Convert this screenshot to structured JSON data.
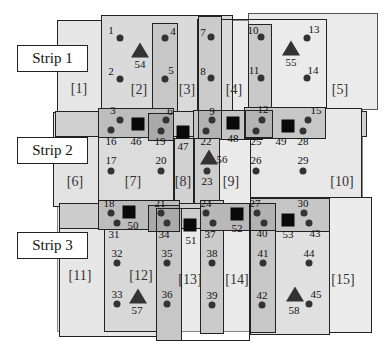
{
  "strips": [
    {
      "label": "Strip 1",
      "x": 17,
      "y": 45,
      "w": 71,
      "h": 27
    },
    {
      "label": "Strip 2",
      "x": 17,
      "y": 137,
      "w": 71,
      "h": 27
    },
    {
      "label": "Strip 3",
      "x": 17,
      "y": 232,
      "w": 71,
      "h": 27
    }
  ],
  "regions": [
    {
      "label": "[1]",
      "x": 79,
      "y": 89
    },
    {
      "label": "[2]",
      "x": 139,
      "y": 90
    },
    {
      "label": "[3]",
      "x": 187,
      "y": 90
    },
    {
      "label": "[4]",
      "x": 234,
      "y": 90
    },
    {
      "label": "[5]",
      "x": 340,
      "y": 90
    },
    {
      "label": "[6]",
      "x": 75,
      "y": 182
    },
    {
      "label": "[7]",
      "x": 133,
      "y": 182
    },
    {
      "label": "[8]",
      "x": 183,
      "y": 182
    },
    {
      "label": "[9]",
      "x": 231,
      "y": 182
    },
    {
      "label": "[10]",
      "x": 342,
      "y": 182
    },
    {
      "label": "[11]",
      "x": 80,
      "y": 276
    },
    {
      "label": "[12]",
      "x": 141,
      "y": 276
    },
    {
      "label": "[13]",
      "x": 190,
      "y": 280
    },
    {
      "label": "[14]",
      "x": 237,
      "y": 280
    },
    {
      "label": "[15]",
      "x": 343,
      "y": 280
    }
  ],
  "points": [
    {
      "id": "1",
      "x": 120,
      "y": 38,
      "lx": 111,
      "ly": 30
    },
    {
      "id": "2",
      "x": 120,
      "y": 79,
      "lx": 111,
      "ly": 71
    },
    {
      "id": "4",
      "x": 165,
      "y": 38,
      "lx": 173,
      "ly": 31
    },
    {
      "id": "5",
      "x": 165,
      "y": 79,
      "lx": 171,
      "ly": 70
    },
    {
      "id": "7",
      "x": 211,
      "y": 37,
      "lx": 203,
      "ly": 32
    },
    {
      "id": "8",
      "x": 211,
      "y": 78,
      "lx": 203,
      "ly": 71
    },
    {
      "id": "10",
      "x": 261,
      "y": 37,
      "lx": 253,
      "ly": 30
    },
    {
      "id": "11",
      "x": 261,
      "y": 78,
      "lx": 254,
      "ly": 70
    },
    {
      "id": "13",
      "x": 307,
      "y": 38,
      "lx": 314,
      "ly": 29
    },
    {
      "id": "14",
      "x": 307,
      "y": 78,
      "lx": 313,
      "ly": 70
    },
    {
      "id": "3",
      "x": 120,
      "y": 120,
      "lx": 113,
      "ly": 110
    },
    {
      "id": "16",
      "x": 111,
      "y": 130,
      "lx": 111,
      "ly": 141
    },
    {
      "id": "6",
      "x": 166,
      "y": 120,
      "lx": 170,
      "ly": 111
    },
    {
      "id": "19",
      "x": 161,
      "y": 131,
      "lx": 160,
      "ly": 141
    },
    {
      "id": "9",
      "x": 212,
      "y": 120,
      "lx": 212,
      "ly": 111
    },
    {
      "id": "22",
      "x": 206,
      "y": 131,
      "lx": 206,
      "ly": 141
    },
    {
      "id": "12",
      "x": 262,
      "y": 120,
      "lx": 263,
      "ly": 109
    },
    {
      "id": "25",
      "x": 256,
      "y": 131,
      "lx": 256,
      "ly": 141
    },
    {
      "id": "15",
      "x": 308,
      "y": 120,
      "lx": 316,
      "ly": 110
    },
    {
      "id": "28",
      "x": 303,
      "y": 131,
      "lx": 303,
      "ly": 141
    },
    {
      "id": "17",
      "x": 111,
      "y": 171,
      "lx": 111,
      "ly": 160
    },
    {
      "id": "20",
      "x": 161,
      "y": 171,
      "lx": 161,
      "ly": 160
    },
    {
      "id": "23",
      "x": 207,
      "y": 171,
      "lx": 207,
      "ly": 181
    },
    {
      "id": "26",
      "x": 256,
      "y": 171,
      "lx": 256,
      "ly": 160
    },
    {
      "id": "29",
      "x": 303,
      "y": 171,
      "lx": 303,
      "ly": 160
    },
    {
      "id": "18",
      "x": 111,
      "y": 213,
      "lx": 109,
      "ly": 203
    },
    {
      "id": "31",
      "x": 117,
      "y": 223,
      "lx": 114,
      "ly": 234
    },
    {
      "id": "21",
      "x": 161,
      "y": 213,
      "lx": 160,
      "ly": 203
    },
    {
      "id": "34",
      "x": 167,
      "y": 223,
      "lx": 164,
      "ly": 234
    },
    {
      "id": "24",
      "x": 206,
      "y": 213,
      "lx": 206,
      "ly": 203
    },
    {
      "id": "37",
      "x": 213,
      "y": 223,
      "lx": 210,
      "ly": 234
    },
    {
      "id": "27",
      "x": 257,
      "y": 213,
      "lx": 255,
      "ly": 203
    },
    {
      "id": "40",
      "x": 264,
      "y": 223,
      "lx": 262,
      "ly": 233
    },
    {
      "id": "30",
      "x": 304,
      "y": 213,
      "lx": 303,
      "ly": 203
    },
    {
      "id": "43",
      "x": 309,
      "y": 223,
      "lx": 315,
      "ly": 233
    },
    {
      "id": "32",
      "x": 117,
      "y": 263,
      "lx": 117,
      "ly": 253
    },
    {
      "id": "35",
      "x": 167,
      "y": 263,
      "lx": 167,
      "ly": 253
    },
    {
      "id": "38",
      "x": 212,
      "y": 263,
      "lx": 212,
      "ly": 253
    },
    {
      "id": "41",
      "x": 263,
      "y": 263,
      "lx": 263,
      "ly": 253
    },
    {
      "id": "44",
      "x": 309,
      "y": 263,
      "lx": 309,
      "ly": 253
    },
    {
      "id": "33",
      "x": 117,
      "y": 304,
      "lx": 117,
      "ly": 294
    },
    {
      "id": "36",
      "x": 167,
      "y": 304,
      "lx": 167,
      "ly": 294
    },
    {
      "id": "39",
      "x": 212,
      "y": 305,
      "lx": 212,
      "ly": 295
    },
    {
      "id": "42",
      "x": 262,
      "y": 305,
      "lx": 262,
      "ly": 295
    },
    {
      "id": "45",
      "x": 309,
      "y": 304,
      "lx": 316,
      "ly": 294
    }
  ],
  "triangles": [
    {
      "id": "54",
      "x": 140,
      "y": 50,
      "lx": 140,
      "ly": 64
    },
    {
      "id": "55",
      "x": 291,
      "y": 48,
      "lx": 291,
      "ly": 62
    },
    {
      "id": "56",
      "x": 209,
      "y": 157,
      "lx": 222,
      "ly": 159
    },
    {
      "id": "57",
      "x": 138,
      "y": 296,
      "lx": 137,
      "ly": 310
    },
    {
      "id": "58",
      "x": 295,
      "y": 294,
      "lx": 294,
      "ly": 310
    }
  ],
  "squares": [
    {
      "id": "46",
      "x": 138,
      "y": 124,
      "lx": 136,
      "ly": 141
    },
    {
      "id": "47",
      "x": 183,
      "y": 132,
      "lx": 183,
      "ly": 146
    },
    {
      "id": "48",
      "x": 233,
      "y": 123,
      "lx": 233,
      "ly": 138
    },
    {
      "id": "49",
      "x": 288,
      "y": 126,
      "lx": 281,
      "ly": 141
    },
    {
      "id": "50",
      "x": 129,
      "y": 212,
      "lx": 133,
      "ly": 225
    },
    {
      "id": "51",
      "x": 190,
      "y": 225,
      "lx": 191,
      "ly": 240
    },
    {
      "id": "52",
      "x": 237,
      "y": 214,
      "lx": 237,
      "ly": 228
    },
    {
      "id": "53",
      "x": 288,
      "y": 220,
      "lx": 288,
      "ly": 234
    }
  ],
  "colors": {
    "outline": "#222222",
    "light_fill": "#e9e9e9",
    "mid_fill": "#d4d4d4",
    "dark_fill": "#b8b8b8",
    "marker": "#333333",
    "square": "#0a0a0a"
  }
}
